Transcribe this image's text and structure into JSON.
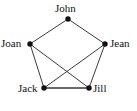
{
  "figure": {
    "name": "friendship-graph",
    "width": 137,
    "height": 111,
    "background": "#ffffff",
    "node_color": "#111111",
    "edge_color": "#3a3a3a",
    "edge_color_highlight": "#6a6a6a",
    "label_color": "#111111"
  },
  "nodes": [
    {
      "id": "john",
      "label": "John",
      "x": 68,
      "y": 19,
      "label_x": 55,
      "label_y": 3,
      "label_align": "center"
    },
    {
      "id": "joan",
      "label": "Joan",
      "x": 30,
      "y": 44,
      "label_x": 1,
      "label_y": 38,
      "label_align": "right"
    },
    {
      "id": "jean",
      "label": "Jean",
      "x": 105,
      "y": 44,
      "label_x": 110,
      "label_y": 38,
      "label_align": "left"
    },
    {
      "id": "jack",
      "label": "Jack",
      "x": 44,
      "y": 88,
      "label_x": 18,
      "label_y": 83,
      "label_align": "right"
    },
    {
      "id": "jill",
      "label": "Jill",
      "x": 89,
      "y": 88,
      "label_x": 93,
      "label_y": 83,
      "label_align": "left"
    }
  ],
  "edges": [
    {
      "id": "john-joan",
      "from": "john",
      "to": "joan",
      "style": "normal"
    },
    {
      "id": "john-jean",
      "from": "john",
      "to": "jean",
      "style": "normal"
    },
    {
      "id": "joan-jack",
      "from": "joan",
      "to": "jack",
      "style": "normal"
    },
    {
      "id": "joan-jill",
      "from": "joan",
      "to": "jill",
      "style": "normal"
    },
    {
      "id": "jean-jill",
      "from": "jean",
      "to": "jill",
      "style": "normal"
    },
    {
      "id": "jean-jack",
      "from": "jean",
      "to": "jack",
      "style": "normal"
    },
    {
      "id": "jack-jill",
      "from": "jack",
      "to": "jill",
      "style": "thick"
    }
  ]
}
